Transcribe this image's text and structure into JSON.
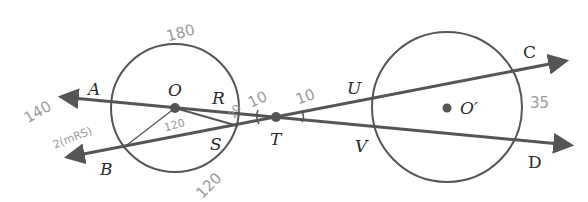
{
  "diagram": {
    "colors": {
      "line": "#555555",
      "text": "#2a2a2a",
      "handwriting": "#9a9a9a"
    },
    "points": {
      "A": "A",
      "B": "B",
      "O": "O",
      "R": "R",
      "S": "S",
      "T": "T",
      "U": "U",
      "V": "V",
      "O_prime": "O′",
      "C": "C",
      "D": "D"
    },
    "annotations": {
      "top_arc": "180",
      "bottom_arc": "120",
      "central_angle": "120",
      "left_value": "140",
      "left_formula": "2(mRS)",
      "angle_at_R": "10",
      "angle_at_T": "10",
      "arc_RS": "20",
      "right_arc": "35"
    }
  }
}
